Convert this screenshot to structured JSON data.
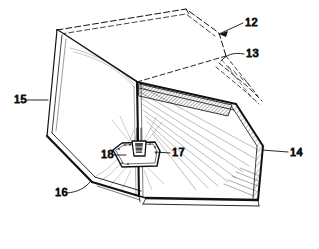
{
  "figure": {
    "kind": "patent-line-drawing",
    "background_color": "#ffffff",
    "ink_color": "#111111",
    "width": 319,
    "height": 249
  },
  "callouts": [
    {
      "id": "callout-12",
      "label": "12",
      "text_x": 245,
      "text_y": 26,
      "leader": "M 243 23 L 219 34",
      "arrow": true,
      "arrow_points": "219,34 228,31 226,37",
      "target": "top-closure-flap"
    },
    {
      "id": "callout-13",
      "label": "13",
      "text_x": 246,
      "text_y": 57,
      "leader": "M 244 54 C 233 52 226 55 221 61",
      "arrow": false,
      "arrow_points": "",
      "target": "right-upper-flap-edge"
    },
    {
      "id": "callout-14",
      "label": "14",
      "text_x": 290,
      "text_y": 156,
      "leader": "M 288 152 L 262 150",
      "arrow": false,
      "arrow_points": "",
      "target": "right-side-panel"
    },
    {
      "id": "callout-15",
      "label": "15",
      "text_x": 14,
      "text_y": 103,
      "leader": "M 26 100 L 48 100",
      "arrow": false,
      "arrow_points": "",
      "target": "left-side-panel"
    },
    {
      "id": "callout-16",
      "label": "16",
      "text_x": 55,
      "text_y": 196,
      "leader": "M 67 193 C 78 192 85 188 90 182",
      "arrow": false,
      "arrow_points": "",
      "target": "lower-left-panel-edge"
    },
    {
      "id": "callout-17",
      "label": "17",
      "text_x": 172,
      "text_y": 156,
      "leader": "M 170 153 L 155 152",
      "arrow": false,
      "arrow_points": "",
      "target": "bracket-body"
    },
    {
      "id": "callout-18",
      "label": "18",
      "text_x": 101,
      "text_y": 158,
      "leader": "M 113 155 L 126 155",
      "arrow": false,
      "arrow_points": "",
      "target": "bracket-flange"
    }
  ],
  "parts": {
    "top_closure_flap": "12",
    "right_upper_flap_edge": "13",
    "right_side_panel": "14",
    "left_side_panel": "15",
    "lower_left_panel_edge": "16",
    "bracket_body": "17",
    "bracket_flange": "18"
  }
}
